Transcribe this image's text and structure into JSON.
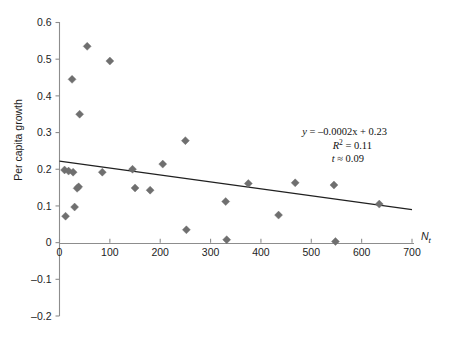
{
  "figure": {
    "background": "#ffffff",
    "marker_color": "#6f6f6f",
    "axis_color": "#8d8d8d",
    "line_color": "#202020"
  },
  "annotations": {
    "equation": "y = –0.0002x + 0.23",
    "equation_y": "y",
    "equation_rest": " = –0.0002x + 0.23",
    "r_squared_symbol": "R",
    "r_squared_exp": "2",
    "r_squared_value": " = 0.11",
    "t_symbol": "t",
    "t_value": " ≈ 0.09"
  },
  "chart_data": {
    "type": "scatter",
    "title": "",
    "xlabel": "Nt",
    "xlabel_main": "N",
    "xlabel_sub": "t",
    "ylabel": "Per capita growth",
    "xlim": [
      0,
      700
    ],
    "ylim": [
      -0.2,
      0.6
    ],
    "xticks": [
      0,
      100,
      200,
      300,
      400,
      500,
      600,
      700
    ],
    "xtick_labels": [
      "0",
      "100",
      "200",
      "300",
      "400",
      "500",
      "600",
      "700"
    ],
    "yticks": [
      -0.2,
      -0.1,
      0,
      0.1,
      0.2,
      0.3,
      0.4,
      0.5,
      0.6
    ],
    "ytick_labels": [
      "–0.2",
      "–0.1",
      "0",
      "0.1",
      "0.2",
      "0.3",
      "0.4",
      "0.5",
      "0.6"
    ],
    "grid": false,
    "legend": false,
    "points": [
      {
        "x": 10,
        "y": 0.198
      },
      {
        "x": 12,
        "y": 0.072
      },
      {
        "x": 18,
        "y": 0.195
      },
      {
        "x": 25,
        "y": 0.445
      },
      {
        "x": 27,
        "y": 0.192
      },
      {
        "x": 30,
        "y": 0.097
      },
      {
        "x": 35,
        "y": 0.148
      },
      {
        "x": 38,
        "y": 0.152
      },
      {
        "x": 40,
        "y": 0.35
      },
      {
        "x": 55,
        "y": 0.535
      },
      {
        "x": 85,
        "y": 0.192
      },
      {
        "x": 100,
        "y": 0.495
      },
      {
        "x": 145,
        "y": 0.2
      },
      {
        "x": 150,
        "y": 0.149
      },
      {
        "x": 180,
        "y": 0.143
      },
      {
        "x": 205,
        "y": 0.214
      },
      {
        "x": 250,
        "y": 0.278
      },
      {
        "x": 252,
        "y": 0.035
      },
      {
        "x": 330,
        "y": 0.112
      },
      {
        "x": 332,
        "y": 0.008
      },
      {
        "x": 375,
        "y": 0.161
      },
      {
        "x": 435,
        "y": 0.075
      },
      {
        "x": 468,
        "y": 0.163
      },
      {
        "x": 545,
        "y": 0.157
      },
      {
        "x": 548,
        "y": 0.003
      },
      {
        "x": 635,
        "y": 0.105
      }
    ],
    "trend_line": {
      "slope": -0.0002,
      "intercept": 0.23,
      "drawn_from": {
        "x": 0,
        "y": 0.222
      },
      "drawn_to": {
        "x": 700,
        "y": 0.09
      }
    },
    "r_squared": 0.11,
    "t_statistic": 0.09
  }
}
